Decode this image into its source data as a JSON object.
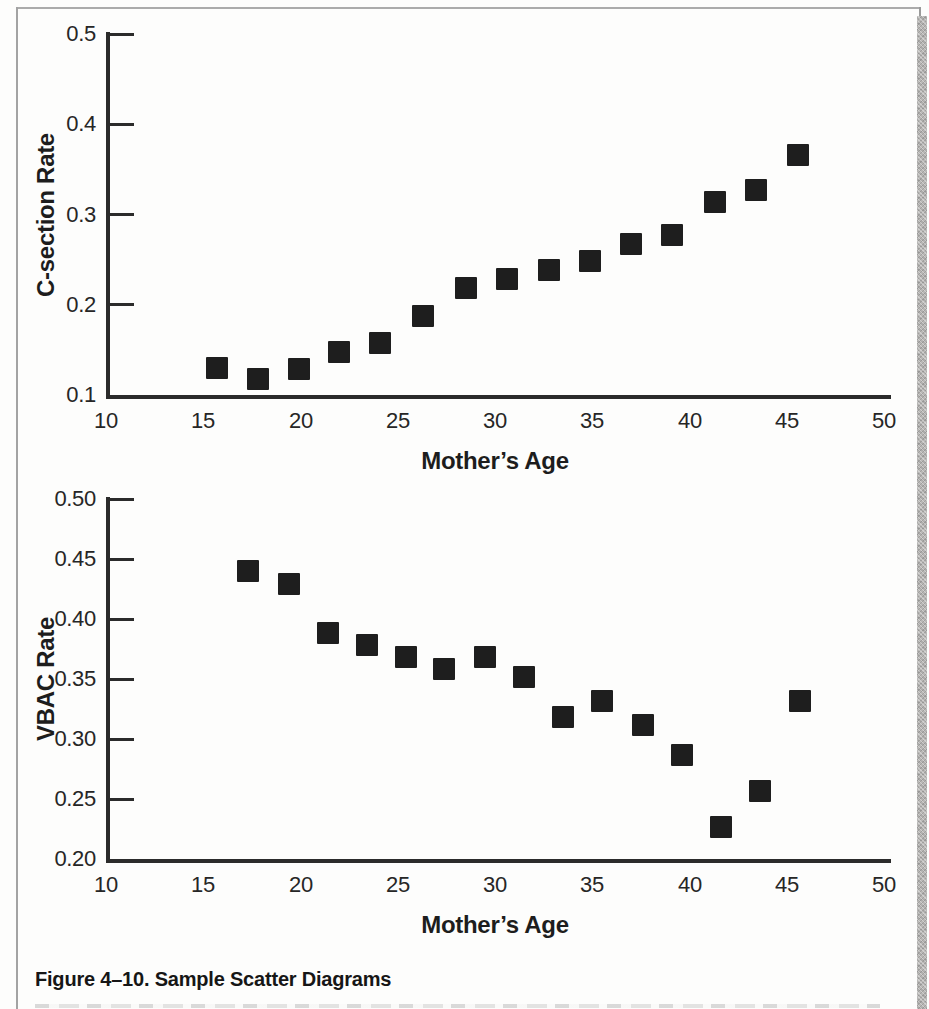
{
  "page": {
    "background": "#fdfdfc",
    "border_color": "#a8a8a8",
    "edge_band_color": "#b8b7b5",
    "caption": "Figure 4–10. Sample Scatter Diagrams"
  },
  "chart_data": [
    {
      "type": "scatter",
      "name": "csection-chart",
      "title": "",
      "xlabel": "Mother’s Age",
      "ylabel": "C-section Rate",
      "x": [
        15.7,
        17.8,
        19.9,
        22.0,
        24.1,
        26.3,
        28.5,
        30.6,
        32.8,
        34.9,
        37.0,
        39.1,
        41.3,
        43.4,
        45.6
      ],
      "y": [
        0.13,
        0.118,
        0.129,
        0.148,
        0.158,
        0.187,
        0.219,
        0.228,
        0.238,
        0.248,
        0.267,
        0.277,
        0.314,
        0.327,
        0.366
      ],
      "x_ticks": [
        10,
        15,
        20,
        25,
        30,
        35,
        40,
        45,
        50
      ],
      "y_tick_labels": [
        "0.5",
        "0.4",
        "0.3",
        "0.2",
        "0.1"
      ],
      "y_tick_values": [
        0.5,
        0.4,
        0.3,
        0.2,
        0.1
      ],
      "xlim": [
        10,
        50
      ],
      "ylim": [
        0.1,
        0.5
      ],
      "grid": false,
      "legend": false,
      "marker": "square",
      "marker_color": "#1e1e1e",
      "layout": {
        "left": 106,
        "right": 891,
        "top": 34,
        "bottom": 395,
        "px_per_x": 19.45,
        "ylabel_x": 46,
        "tick_len": 28
      }
    },
    {
      "type": "scatter",
      "name": "vbac-chart",
      "title": "",
      "xlabel": "Mother’s Age",
      "ylabel": "VBAC Rate",
      "x": [
        17.3,
        19.4,
        21.4,
        23.4,
        25.4,
        27.4,
        29.5,
        31.5,
        33.5,
        35.5,
        37.6,
        39.6,
        41.6,
        43.6,
        45.7
      ],
      "y": [
        0.44,
        0.429,
        0.388,
        0.378,
        0.368,
        0.358,
        0.368,
        0.352,
        0.318,
        0.332,
        0.312,
        0.287,
        0.227,
        0.257,
        0.332
      ],
      "x_ticks": [
        10,
        15,
        20,
        25,
        30,
        35,
        40,
        45,
        50
      ],
      "y_tick_labels": [
        "0.50",
        "0.45",
        "0.40",
        "0.35",
        "0.30",
        "0.25",
        "0.20"
      ],
      "y_tick_values": [
        0.5,
        0.45,
        0.4,
        0.35,
        0.3,
        0.25,
        0.2
      ],
      "xlim": [
        10,
        50
      ],
      "ylim": [
        0.2,
        0.5
      ],
      "grid": false,
      "legend": false,
      "marker": "square",
      "marker_color": "#1e1e1e",
      "layout": {
        "left": 106,
        "right": 891,
        "top": 499,
        "bottom": 859,
        "px_per_x": 19.45,
        "ylabel_x": 46,
        "tick_len": 28
      }
    }
  ]
}
